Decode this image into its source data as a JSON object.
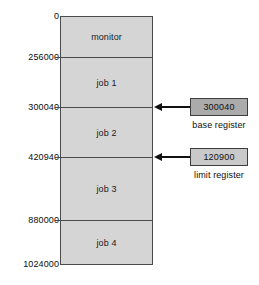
{
  "diagram": {
    "memory": {
      "segments": [
        {
          "name": "monitor",
          "label": "monitor",
          "start": 0,
          "end": 256000
        },
        {
          "name": "job-1",
          "label": "job 1",
          "start": 256000,
          "end": 300040
        },
        {
          "name": "job-2",
          "label": "job 2",
          "start": 300040,
          "end": 420940
        },
        {
          "name": "job-3",
          "label": "job 3",
          "start": 420940,
          "end": 880000
        },
        {
          "name": "job-4",
          "label": "job 4",
          "start": 880000,
          "end": 1024000
        }
      ],
      "address_labels": [
        {
          "value": "0"
        },
        {
          "value": "256000"
        },
        {
          "value": "300040"
        },
        {
          "value": "420940"
        },
        {
          "value": "880000"
        },
        {
          "value": "1024000"
        }
      ],
      "fill_color": "#d5d5d5",
      "border_color": "#4a4a4a"
    },
    "registers": [
      {
        "name": "base-register",
        "value": "300040",
        "caption": "base register",
        "fill_color": "#ababab",
        "points_to": "300040"
      },
      {
        "name": "limit-register",
        "value": "120900",
        "caption": "limit register",
        "fill_color": "#c9c9c9",
        "points_to": "420940"
      }
    ]
  }
}
